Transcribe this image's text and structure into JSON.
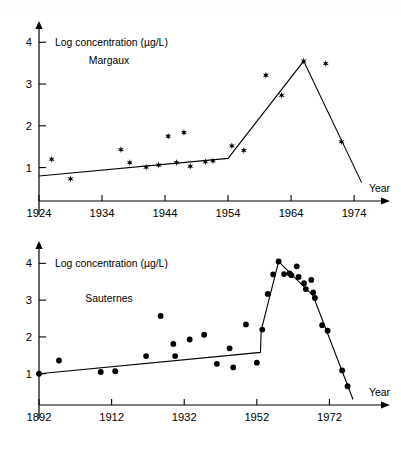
{
  "figure": {
    "marker_color": "#000000",
    "line_color": "#000000",
    "axis_color": "#000000",
    "background": "#ffffff"
  },
  "chart_data": [
    {
      "type": "scatter",
      "id": "margaux",
      "title": "",
      "series_label": "Margaux",
      "xlabel": "Year",
      "ylabel": "Log concentration (µg/L)",
      "marker": "star",
      "grid": false,
      "legend": "none",
      "xlim": [
        1924,
        1977
      ],
      "ylim": [
        0.2,
        4.15
      ],
      "xticks": [
        1924,
        1934,
        1944,
        1954,
        1964,
        1974
      ],
      "xticklabels": [
        "1924",
        "1934",
        "1944",
        "1954",
        "1964",
        "1974"
      ],
      "yticks": [
        1,
        2,
        3,
        4
      ],
      "yticklabels": [
        "1",
        "2",
        "3",
        "4"
      ],
      "points": [
        {
          "x": 1926.0,
          "y": 1.2
        },
        {
          "x": 1929.0,
          "y": 0.73
        },
        {
          "x": 1937.0,
          "y": 1.43
        },
        {
          "x": 1938.4,
          "y": 1.12
        },
        {
          "x": 1941.0,
          "y": 1.01
        },
        {
          "x": 1943.0,
          "y": 1.06
        },
        {
          "x": 1944.5,
          "y": 1.75
        },
        {
          "x": 1945.8,
          "y": 1.12
        },
        {
          "x": 1947.0,
          "y": 1.84
        },
        {
          "x": 1948.0,
          "y": 1.03
        },
        {
          "x": 1950.4,
          "y": 1.14
        },
        {
          "x": 1951.6,
          "y": 1.16
        },
        {
          "x": 1954.6,
          "y": 1.52
        },
        {
          "x": 1956.5,
          "y": 1.41
        },
        {
          "x": 1960.0,
          "y": 3.21
        },
        {
          "x": 1962.5,
          "y": 2.73
        },
        {
          "x": 1966.0,
          "y": 3.55
        },
        {
          "x": 1969.5,
          "y": 3.49
        },
        {
          "x": 1972.0,
          "y": 1.62
        }
      ],
      "fit_line": [
        {
          "x": 1924.0,
          "y": 0.8
        },
        {
          "x": 1954.0,
          "y": 1.22
        },
        {
          "x": 1966.0,
          "y": 3.55
        },
        {
          "x": 1975.2,
          "y": 0.64
        }
      ]
    },
    {
      "type": "scatter",
      "id": "sauternes",
      "title": "",
      "series_label": "Sauternes",
      "xlabel": "Year",
      "ylabel": "Log concentration (µg/L)",
      "marker": "circle",
      "grid": false,
      "legend": "none",
      "xlim": [
        1892,
        1984
      ],
      "ylim": [
        0.15,
        4.2
      ],
      "xticks": [
        1892,
        1912,
        1932,
        1952,
        1972
      ],
      "xticklabels": [
        "1892",
        "1912",
        "1932",
        "1952",
        "1972"
      ],
      "yticks": [
        1,
        2,
        3,
        4
      ],
      "yticklabels": [
        "1",
        "2",
        "3",
        "4"
      ],
      "points": [
        {
          "x": 1892.0,
          "y": 1.0
        },
        {
          "x": 1897.5,
          "y": 1.36
        },
        {
          "x": 1909.0,
          "y": 1.05
        },
        {
          "x": 1913.0,
          "y": 1.07
        },
        {
          "x": 1921.5,
          "y": 1.48
        },
        {
          "x": 1925.5,
          "y": 2.57
        },
        {
          "x": 1929.0,
          "y": 1.81
        },
        {
          "x": 1929.5,
          "y": 1.48
        },
        {
          "x": 1933.5,
          "y": 1.93
        },
        {
          "x": 1937.5,
          "y": 2.06
        },
        {
          "x": 1941.0,
          "y": 1.27
        },
        {
          "x": 1944.5,
          "y": 1.69
        },
        {
          "x": 1945.5,
          "y": 1.17
        },
        {
          "x": 1949.0,
          "y": 2.34
        },
        {
          "x": 1952.0,
          "y": 1.3
        },
        {
          "x": 1953.5,
          "y": 2.2
        },
        {
          "x": 1955.0,
          "y": 3.17
        },
        {
          "x": 1956.5,
          "y": 3.7
        },
        {
          "x": 1958.0,
          "y": 4.05
        },
        {
          "x": 1959.5,
          "y": 3.71
        },
        {
          "x": 1961.0,
          "y": 3.73
        },
        {
          "x": 1961.5,
          "y": 3.68
        },
        {
          "x": 1963.0,
          "y": 3.92
        },
        {
          "x": 1963.5,
          "y": 3.63
        },
        {
          "x": 1965.0,
          "y": 3.46
        },
        {
          "x": 1965.5,
          "y": 3.3
        },
        {
          "x": 1967.0,
          "y": 3.55
        },
        {
          "x": 1967.5,
          "y": 3.21
        },
        {
          "x": 1968.0,
          "y": 3.06
        },
        {
          "x": 1970.0,
          "y": 2.32
        },
        {
          "x": 1971.5,
          "y": 2.17
        },
        {
          "x": 1975.5,
          "y": 1.09
        },
        {
          "x": 1977.0,
          "y": 0.66
        }
      ],
      "fit_line": [
        {
          "x": 1892.0,
          "y": 1.0
        },
        {
          "x": 1953.0,
          "y": 1.58
        },
        {
          "x": 1953.2,
          "y": 2.18
        },
        {
          "x": 1958.0,
          "y": 4.05
        },
        {
          "x": 1967.5,
          "y": 3.12
        },
        {
          "x": 1978.5,
          "y": 0.3
        }
      ]
    }
  ]
}
